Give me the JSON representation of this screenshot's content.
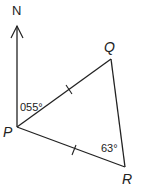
{
  "diagram": {
    "north_label": "N",
    "points": {
      "P": {
        "label": "P"
      },
      "Q": {
        "label": "Q"
      },
      "R": {
        "label": "R"
      }
    },
    "angles": {
      "bearing_PQ": "055°",
      "angle_R": "63°"
    },
    "equal_sides": [
      "PQ",
      "PR"
    ],
    "line_color": "#222222"
  }
}
